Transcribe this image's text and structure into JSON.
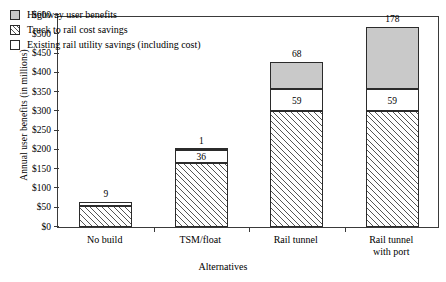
{
  "chart_data": {
    "type": "bar",
    "subtype": "stacked-bar",
    "title": "",
    "xlabel": "Alternatives",
    "ylabel": "Annual user benefits (in millions)",
    "categories": [
      "No build",
      "TSM/float",
      "Rail tunnel",
      "Rail tunnel with port"
    ],
    "category_lines": [
      [
        "No build"
      ],
      [
        "TSM/float"
      ],
      [
        "Rail tunnel"
      ],
      [
        "Rail tunnel",
        "with port"
      ]
    ],
    "series": [
      {
        "name": "Existing rail utility savings (including cost)",
        "swatch": "hatch",
        "values": [
          55,
          165,
          300,
          300
        ],
        "labels": [
          "",
          "",
          "",
          ""
        ]
      },
      {
        "name": "Truck to rail cost savings",
        "swatch": "white",
        "values": [
          9,
          36,
          59,
          59
        ],
        "labels": [
          "",
          "36",
          "59",
          "59"
        ]
      },
      {
        "name": "Highway user benefits",
        "swatch": "gray",
        "values": [
          0,
          1,
          68,
          178
        ],
        "labels": [
          "",
          "",
          "",
          ""
        ]
      }
    ],
    "top_labels": [
      "9",
      "1",
      "68",
      "178"
    ],
    "ytick_labels": [
      "$600",
      "$500",
      "$450",
      "$400",
      "$350",
      "$300",
      "$250",
      "$200",
      "$150",
      "$100",
      "$50",
      "$0"
    ],
    "ytick_values": [
      600,
      500,
      450,
      400,
      350,
      300,
      250,
      200,
      150,
      100,
      50,
      0
    ],
    "grid": false,
    "legend_position": "top-left",
    "legend_order": [
      "Highway user benefits",
      "Truck to rail cost savings",
      "Existing rail utility savings (including cost)"
    ],
    "colors": {
      "gray_fill": "#c9c9c9",
      "white_fill": "#ffffff",
      "hatch_line": "#555555",
      "axis": "#3a3a3a",
      "text": "#000000"
    }
  },
  "legend": {
    "items": [
      {
        "label": "Highway user benefits",
        "swatch": "gray"
      },
      {
        "label": "Truck to rail cost savings",
        "swatch": "hatch"
      },
      {
        "label": "Existing rail utility savings (including cost)",
        "swatch": "white"
      }
    ]
  },
  "axes": {
    "y_title": "Annual user benefits (in millions)",
    "x_title": "Alternatives"
  }
}
